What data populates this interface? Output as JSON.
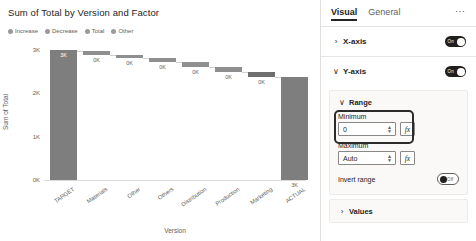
{
  "chart_data": {
    "type": "bar",
    "subtype": "waterfall",
    "title": "Sum of Total by Version and Factor",
    "xlabel": "Version",
    "ylabel": "Sum of Total",
    "categories": [
      "TARGET",
      "Materials",
      "Other",
      "Others",
      "Distribution",
      "Production",
      "Marketing",
      "ACTUAL"
    ],
    "values": [
      3000,
      -40,
      -60,
      -70,
      -90,
      -110,
      -130,
      2500
    ],
    "data_labels": [
      "3K",
      "0K",
      "0K",
      "0K",
      "0K",
      "0K",
      "0K",
      "3K"
    ],
    "kinds": [
      "total",
      "decrease",
      "decrease",
      "decrease",
      "decrease",
      "decrease",
      "decrease",
      "total"
    ],
    "ylim": [
      0,
      3000
    ],
    "yticks": [
      0,
      1000,
      2000,
      3000
    ],
    "ytick_labels": [
      "0K",
      "1K",
      "2K",
      "3K"
    ],
    "grid": false,
    "legend_position": "top",
    "legend": [
      {
        "label": "Increase",
        "color": "#9a9a9a"
      },
      {
        "label": "Decrease",
        "color": "#9a9a9a"
      },
      {
        "label": "Total",
        "color": "#9a9a9a"
      },
      {
        "label": "Other",
        "color": "#9a9a9a"
      }
    ],
    "bars": [
      {
        "category": "TARGET",
        "label": "3K",
        "left": 6,
        "width": 27,
        "top": 0,
        "height": 130,
        "kind": "total",
        "label_inside": true
      },
      {
        "category": "Materials",
        "label": "0K",
        "left": 39,
        "width": 27,
        "top": 1,
        "height": 3.5,
        "kind": "decrease",
        "label_inside": false
      },
      {
        "category": "Other",
        "label": "0K",
        "left": 72,
        "width": 27,
        "top": 4.5,
        "height": 3.5,
        "kind": "decrease",
        "label_inside": false
      },
      {
        "category": "Others",
        "label": "0K",
        "left": 105,
        "width": 27,
        "top": 8,
        "height": 4,
        "kind": "decrease",
        "label_inside": false
      },
      {
        "category": "Distribution",
        "label": "0K",
        "left": 138,
        "width": 27,
        "top": 12,
        "height": 4.5,
        "kind": "decrease",
        "label_inside": false
      },
      {
        "category": "Production",
        "label": "0K",
        "left": 171,
        "width": 27,
        "top": 16.5,
        "height": 5,
        "kind": "decrease",
        "label_inside": false
      },
      {
        "category": "Marketing",
        "label": "0K",
        "left": 204,
        "width": 27,
        "top": 21.5,
        "height": 5.5,
        "kind": "highlight",
        "label_inside": false
      },
      {
        "category": "ACTUAL",
        "label": "3K",
        "left": 237,
        "width": 27,
        "top": 27,
        "height": 103,
        "kind": "total",
        "label_inside": false
      }
    ],
    "connectors": [
      {
        "left": 33,
        "width": 6,
        "top": 1
      },
      {
        "left": 66,
        "width": 6,
        "top": 4.5
      },
      {
        "left": 99,
        "width": 6,
        "top": 8
      },
      {
        "left": 132,
        "width": 6,
        "top": 12
      },
      {
        "left": 165,
        "width": 6,
        "top": 16.5
      },
      {
        "left": 198,
        "width": 6,
        "top": 21.5
      },
      {
        "left": 231,
        "width": 6,
        "top": 27
      }
    ]
  },
  "pane": {
    "tabs": [
      {
        "id": "visual",
        "label": "Visual",
        "active": true
      },
      {
        "id": "general",
        "label": "General",
        "active": false
      }
    ],
    "more_label": "…",
    "sections": [
      {
        "id": "x-axis",
        "label": "X-axis",
        "expanded": false,
        "chevron": "›",
        "toggle": {
          "state": "On",
          "label": "On"
        }
      },
      {
        "id": "y-axis",
        "label": "Y-axis",
        "expanded": true,
        "chevron": "∨",
        "toggle": {
          "state": "On",
          "label": "On"
        }
      }
    ],
    "range_card": {
      "chevron": "∨",
      "title": "Range",
      "minimum": {
        "label": "Minimum",
        "value": "0",
        "placeholder": "Auto",
        "fx_label": "fx",
        "highlighted": true
      },
      "maximum": {
        "label": "Maximum",
        "value": "Auto",
        "placeholder": "Auto",
        "fx_label": "fx",
        "highlighted": false
      },
      "invert_range": {
        "label": "Invert range",
        "toggle": {
          "state": "Off",
          "label": "Off"
        }
      }
    },
    "values_section": {
      "id": "values",
      "label": "Values",
      "chevron": "›",
      "expanded": false
    }
  },
  "colors": {
    "bar_total": "#7e7e7e",
    "bar_decrease": "#8f8f8f",
    "accent": "#252423",
    "panel_bg": "#faf9f8"
  }
}
